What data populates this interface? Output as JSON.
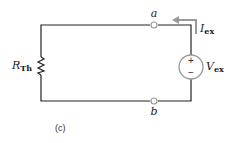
{
  "diagram": {
    "type": "circuit",
    "caption": "(c)",
    "resistor": {
      "symbol": "R",
      "subscript": "Th"
    },
    "source": {
      "symbol": "V",
      "subscript": "ex",
      "plus": "+",
      "minus": "−"
    },
    "current": {
      "symbol": "I",
      "subscript": "ex"
    },
    "terminals": {
      "top": "a",
      "bottom": "b"
    },
    "colors": {
      "wire": "#222222",
      "terminal": "#999999",
      "arrow": "#999999",
      "source_outline": "#999999"
    }
  }
}
